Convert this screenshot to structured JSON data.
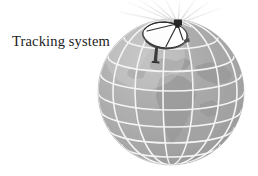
{
  "figure": {
    "kind": "technical-illustration",
    "background_color": "#ffffff"
  },
  "labels": {
    "tracking_system": "Tracking system"
  },
  "globe": {
    "name": "earth-globe",
    "center_x": 171,
    "center_y": 92,
    "radius": 73,
    "fill_color": "#ababab",
    "shade_light_color": "#c0c0c0",
    "shade_dark_color": "#9a9a9a",
    "grid_color": "#f2f2f2",
    "grid_width": 1.6,
    "continent_color": "#9c9c9c",
    "meridian_count": 7,
    "parallel_count": 6
  },
  "antenna": {
    "name": "satellite-dish-antenna",
    "dish_fill_color": "#fbfbfb",
    "dish_edge_color": "#3a3a3a",
    "dish_back_color": "#6d6d6d",
    "mast_color": "#3d3d3d",
    "feed_color": "#2a2a2a",
    "mount_x": 158,
    "mount_y": 60,
    "dish_center_x": 167,
    "dish_center_y": 33,
    "beam_color": "#e8e8e8",
    "beam_ray_count": 9
  }
}
